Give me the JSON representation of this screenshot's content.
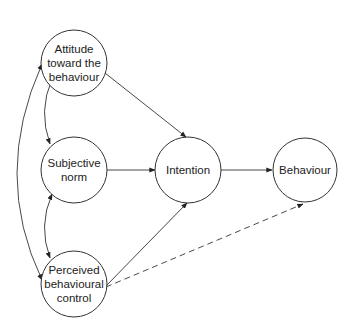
{
  "diagram": {
    "type": "path-model",
    "nodes": {
      "attitude": {
        "lines": [
          "Attitude",
          "toward the",
          "behaviour"
        ]
      },
      "subjective_norm": {
        "lines": [
          "Subjective",
          "norm"
        ]
      },
      "perceived_control": {
        "lines": [
          "Perceived",
          "behavioural",
          "control"
        ]
      },
      "intention": {
        "lines": [
          "Intention"
        ]
      },
      "behaviour": {
        "lines": [
          "Behaviour"
        ]
      }
    },
    "edges": [
      {
        "from": "Attitude toward the behaviour",
        "to": "Intention",
        "style": "solid",
        "direction": "forward"
      },
      {
        "from": "Subjective norm",
        "to": "Intention",
        "style": "solid",
        "direction": "forward"
      },
      {
        "from": "Perceived behavioural control",
        "to": "Intention",
        "style": "solid",
        "direction": "forward"
      },
      {
        "from": "Intention",
        "to": "Behaviour",
        "style": "solid",
        "direction": "forward"
      },
      {
        "from": "Perceived behavioural control",
        "to": "Behaviour",
        "style": "dashed",
        "direction": "forward"
      },
      {
        "from": "Attitude toward the behaviour",
        "to": "Subjective norm",
        "style": "solid",
        "direction": "bidirectional"
      },
      {
        "from": "Subjective norm",
        "to": "Perceived behavioural control",
        "style": "solid",
        "direction": "bidirectional"
      },
      {
        "from": "Attitude toward the behaviour",
        "to": "Perceived behavioural control",
        "style": "solid",
        "direction": "bidirectional"
      }
    ],
    "colors": {
      "stroke": "#333333",
      "text": "#222222",
      "background": "#ffffff"
    }
  }
}
